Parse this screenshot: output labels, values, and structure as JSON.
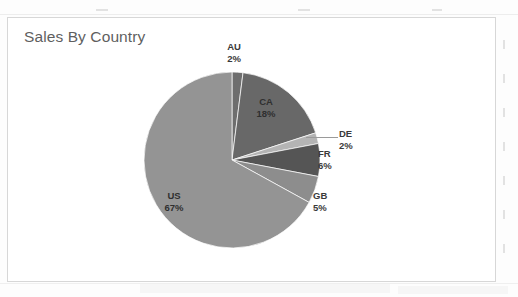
{
  "page": {
    "background_color": "#fdfdfd",
    "frame_border_color": "#d7d7d7"
  },
  "chart_data": {
    "type": "pie",
    "title": "Sales By Country",
    "xlabel": "",
    "ylabel": "",
    "legend_position": "none",
    "grid": false,
    "start_angle_deg": 0,
    "direction": "clockwise",
    "categories": [
      "AU",
      "CA",
      "DE",
      "FR",
      "GB",
      "US"
    ],
    "values": [
      2,
      18,
      2,
      6,
      5,
      67
    ],
    "value_unit": "%",
    "slices": [
      {
        "label": "AU",
        "percent_text": "2%",
        "value": 2,
        "color": "#6e6e6e",
        "label_placement": "outside-top",
        "leader_line": false
      },
      {
        "label": "CA",
        "percent_text": "18%",
        "value": 18,
        "color": "#686868",
        "label_placement": "inside",
        "leader_line": false
      },
      {
        "label": "DE",
        "percent_text": "2%",
        "value": 2,
        "color": "#b4b4b4",
        "label_placement": "outside-right",
        "leader_line": true
      },
      {
        "label": "FR",
        "percent_text": "6%",
        "value": 6,
        "color": "#555555",
        "label_placement": "outside-right",
        "leader_line": false
      },
      {
        "label": "GB",
        "percent_text": "5%",
        "value": 5,
        "color": "#8d8d8d",
        "label_placement": "outside-right",
        "leader_line": false
      },
      {
        "label": "US",
        "percent_text": "67%",
        "value": 67,
        "color": "#949494",
        "label_placement": "inside",
        "leader_line": false
      }
    ]
  },
  "geometry": {
    "center_x": 232,
    "center_y": 160,
    "radius": 88
  }
}
